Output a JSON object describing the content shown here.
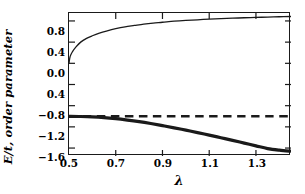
{
  "chart_data": {
    "type": "line",
    "title": "",
    "xlabel": "λ",
    "ylabel": "E/t, order parameter",
    "xlim": [
      0.5,
      1.45
    ],
    "ylim": [
      -1.75,
      0.95
    ],
    "grid": false,
    "legend": "none",
    "xticks": [
      "0.5",
      "0.7",
      "0.9",
      "1.1",
      "1.3"
    ],
    "xtick_values": [
      0.5,
      0.7,
      0.9,
      1.1,
      1.3
    ],
    "yticks": [
      "0.8",
      "0.4",
      "0.0",
      "0.4",
      "−0.8",
      "−1.2",
      "−1.6"
    ],
    "ytick_values": [
      0.8,
      0.4,
      0.0,
      -0.4,
      -0.8,
      -1.2,
      -1.6
    ],
    "series": [
      {
        "name": "order parameter",
        "style": "thin-solid",
        "color": "#1a1a1a",
        "x": [
          0.5,
          0.505,
          0.515,
          0.53,
          0.55,
          0.575,
          0.6,
          0.63,
          0.66,
          0.7,
          0.74,
          0.78,
          0.82,
          0.86,
          0.9,
          0.95,
          1.0,
          1.05,
          1.1,
          1.15,
          1.2,
          1.25,
          1.3,
          1.35,
          1.4,
          1.45
        ],
        "y": [
          0.0,
          0.13,
          0.22,
          0.31,
          0.4,
          0.47,
          0.52,
          0.57,
          0.61,
          0.655,
          0.69,
          0.715,
          0.74,
          0.76,
          0.775,
          0.795,
          0.81,
          0.822,
          0.834,
          0.844,
          0.852,
          0.86,
          0.867,
          0.873,
          0.879,
          0.884
        ]
      },
      {
        "name": "ground state energy E/t",
        "style": "thick-solid",
        "color": "#1a1a1a",
        "x": [
          0.5,
          0.55,
          0.6,
          0.65,
          0.7,
          0.75,
          0.8,
          0.85,
          0.9,
          0.95,
          1.0,
          1.05,
          1.1,
          1.15,
          1.2,
          1.25,
          1.3,
          1.35,
          1.4,
          1.45
        ],
        "y": [
          -1.0,
          -1.004,
          -1.012,
          -1.026,
          -1.046,
          -1.072,
          -1.102,
          -1.137,
          -1.176,
          -1.218,
          -1.262,
          -1.308,
          -1.356,
          -1.405,
          -1.455,
          -1.506,
          -1.558,
          -1.61,
          -1.64,
          -1.66
        ]
      },
      {
        "name": "reference energy",
        "style": "dashed",
        "color": "#1a1a1a",
        "x": [
          0.5,
          1.45
        ],
        "y": [
          -1.0,
          -1.0
        ]
      }
    ]
  }
}
